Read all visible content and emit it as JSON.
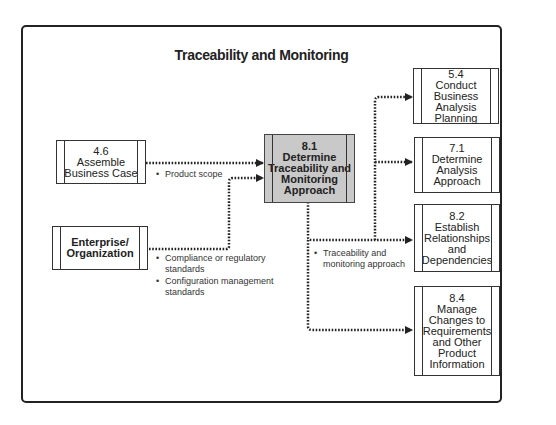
{
  "title": "Traceability and Monitoring",
  "inputs": [
    {
      "id": "4.6",
      "number": "4.6",
      "lines": [
        "Assemble",
        "Business Case"
      ]
    },
    {
      "id": "enterprise",
      "number": "",
      "lines": [
        "Enterprise/",
        "Organization"
      ]
    }
  ],
  "center": {
    "number": "8.1",
    "lines": [
      "Determine",
      "Traceability and",
      "Monitoring",
      "Approach"
    ]
  },
  "outputs": [
    {
      "number": "5.4",
      "lines": [
        "Conduct",
        "Business",
        "Analysis Planning"
      ]
    },
    {
      "number": "7.1",
      "lines": [
        "Determine",
        "Analysis",
        "Approach"
      ]
    },
    {
      "number": "8.2",
      "lines": [
        "Establish",
        "Relationships",
        "and",
        "Dependencies"
      ]
    },
    {
      "number": "8.4",
      "lines": [
        "Manage",
        "Changes to",
        "Requirements",
        "and Other",
        "Product",
        "Information"
      ]
    }
  ],
  "notes": {
    "product_scope": "Product scope",
    "compliance": [
      "Compliance or regulatory",
      "standards"
    ],
    "config": [
      "Configuration management",
      "standards"
    ],
    "traceability": [
      "Traceability and",
      "monitoring approach"
    ]
  }
}
